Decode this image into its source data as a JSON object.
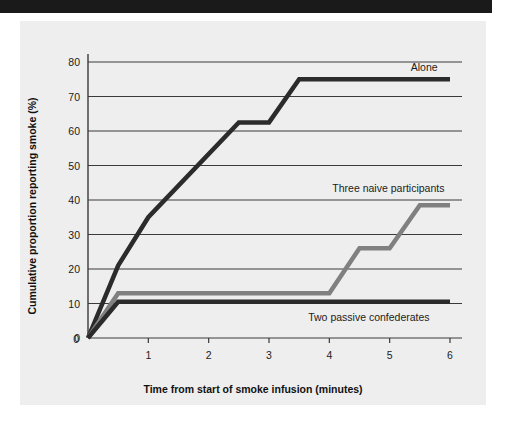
{
  "figure": {
    "background_color": "#ffffff",
    "panel_color": "#eeeeee",
    "banner_color": "#1a1a1a"
  },
  "chart_data": {
    "type": "line",
    "title": "",
    "subtitle": "",
    "xlabel": "Time from start of smoke infusion (minutes)",
    "ylabel": "Cumulative proportion reporting smoke (%)",
    "xlim": [
      0,
      6
    ],
    "ylim": [
      0,
      80
    ],
    "xticks": [
      0,
      1,
      2,
      3,
      4,
      5,
      6
    ],
    "xtick_labels": [
      "0",
      "1",
      "2",
      "3",
      "4",
      "5",
      "6"
    ],
    "yticks": [
      0,
      10,
      20,
      30,
      40,
      50,
      60,
      70,
      80
    ],
    "ytick_labels": [
      "0",
      "10",
      "20",
      "30",
      "40",
      "50",
      "60",
      "70",
      "80"
    ],
    "grid": "horizontal",
    "grid_color": "#3a3a3a",
    "legend_position": "inline-annotations",
    "series": [
      {
        "name": "Alone",
        "label": "Alone",
        "color": "#2b2b2b",
        "width": 4.5,
        "label_x": 5.35,
        "label_y": 78.5,
        "x": [
          0,
          0.5,
          1.0,
          2.5,
          3.0,
          3.5,
          6.0
        ],
        "y": [
          0,
          21,
          35,
          62.5,
          62.5,
          75,
          75
        ]
      },
      {
        "name": "Three naive participants",
        "label": "Three naive participants",
        "color": "#808080",
        "width": 4.5,
        "label_x": 4.05,
        "label_y": 43.5,
        "x": [
          0,
          0.5,
          4.0,
          4.5,
          5.0,
          5.5,
          6.0
        ],
        "y": [
          0,
          13,
          13,
          26,
          26,
          38.5,
          38.5
        ]
      },
      {
        "name": "Two passive confederates",
        "label": "Two passive confederates",
        "color": "#2b2b2b",
        "width": 4.5,
        "label_x": 3.65,
        "label_y": 6.0,
        "x": [
          0,
          0.5,
          6.0
        ],
        "y": [
          0,
          10.5,
          10.5
        ]
      }
    ]
  }
}
